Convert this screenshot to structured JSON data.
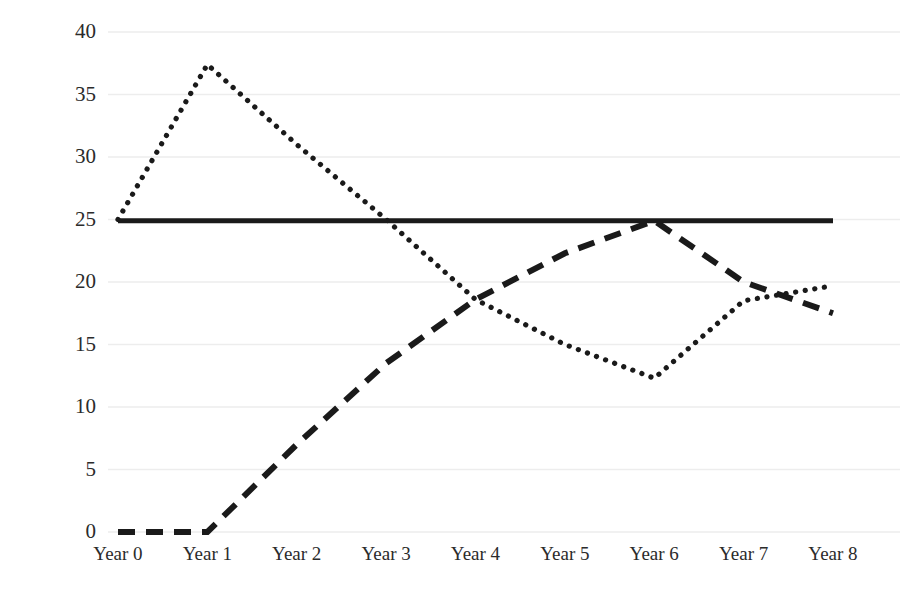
{
  "chart_data": {
    "type": "line",
    "title": "",
    "subtitle": "",
    "xlabel": "",
    "ylabel": "",
    "categories": [
      "Year 0",
      "Year 1",
      "Year 2",
      "Year 3",
      "Year 4",
      "Year 5",
      "Year 6",
      "Year 7",
      "Year 8"
    ],
    "ylim": [
      0,
      40
    ],
    "yticks": [
      0,
      5,
      10,
      15,
      20,
      25,
      30,
      35,
      40
    ],
    "ytick_labels": [
      "0",
      "5",
      "10",
      "15",
      "20",
      "25",
      "30",
      "35",
      "40"
    ],
    "grid": true,
    "grid_axis": "y",
    "legend": false,
    "legend_position": "none",
    "series": [
      {
        "name": "dotted-series",
        "style": "dotted",
        "color": "#1a1a1a",
        "values": [
          25.0,
          37.4,
          31.0,
          25.0,
          18.6,
          15.0,
          12.3,
          18.5,
          19.7
        ]
      },
      {
        "name": "dashed-series",
        "style": "dashed",
        "color": "#1a1a1a",
        "values": [
          0.0,
          0.0,
          7.0,
          13.5,
          18.6,
          22.3,
          24.9,
          20.0,
          17.5
        ]
      },
      {
        "name": "solid-series",
        "style": "solid",
        "color": "#1a1a1a",
        "values": [
          24.9,
          24.9,
          24.9,
          24.9,
          24.9,
          24.9,
          24.9,
          24.9,
          24.9
        ]
      }
    ]
  },
  "colors": {
    "background": "#ffffff",
    "line": "#1a1a1a",
    "gridline": "#ededed",
    "axis_text": "#2b2b2b"
  }
}
